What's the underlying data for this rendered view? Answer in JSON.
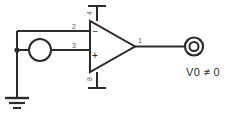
{
  "diagram": {
    "type": "schematic"
  },
  "opamp": {
    "name": "operational-amplifier",
    "pins": {
      "output": "1",
      "inverting_input": "2",
      "noninverting_input": "3",
      "v_plus_supply": "4",
      "v_minus_supply": "8"
    },
    "polarity_inverting": "−",
    "polarity_noninverting": "+"
  },
  "source": {
    "name": "voltage-source",
    "label": ""
  },
  "ground": {
    "name": "ground-symbol",
    "label": ""
  },
  "output_terminal": {
    "name": "output-port",
    "label": ""
  },
  "annotations": {
    "output_voltage": "V0 ≠ 0"
  },
  "colors": {
    "wire": "#2b2b2b",
    "pin_label": "#5a5a5a",
    "background": "#ffffff"
  }
}
